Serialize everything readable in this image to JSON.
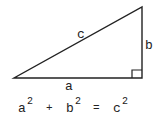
{
  "diagram": {
    "type": "right-triangle",
    "labels": {
      "hypotenuse": "c",
      "vertical_leg": "b",
      "horizontal_leg": "a"
    },
    "equation": {
      "a": "a",
      "b": "b",
      "c": "c",
      "exp": "2",
      "plus": "+",
      "equals": "="
    },
    "colors": {
      "stroke": "#222222",
      "background": "#ffffff"
    }
  }
}
